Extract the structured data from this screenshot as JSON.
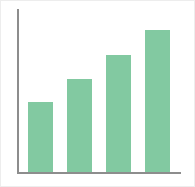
{
  "figure": {
    "width": 195,
    "height": 187,
    "background_color": "#ffffff",
    "border_color": "#ededed"
  },
  "axes": {
    "axis_color": "#8d8d8d",
    "y_axis_name": "y-axis",
    "x_axis_name": "x-axis",
    "grid": false,
    "tick_labels_visible": false
  },
  "chart_data": {
    "type": "bar",
    "title": "",
    "subtitle": "",
    "xlabel": "",
    "ylabel": "",
    "categories": [
      "1",
      "2",
      "3",
      "4"
    ],
    "values": [
      43,
      57,
      72,
      87
    ],
    "ylim": [
      0,
      100
    ],
    "xtick_labels": [],
    "ytick_labels": [],
    "grid": false,
    "legend": null,
    "legend_position": "none",
    "annotations": [],
    "series": [
      {
        "name": "",
        "color": "#82c9a1",
        "values": [
          43,
          57,
          72,
          87
        ]
      }
    ]
  }
}
